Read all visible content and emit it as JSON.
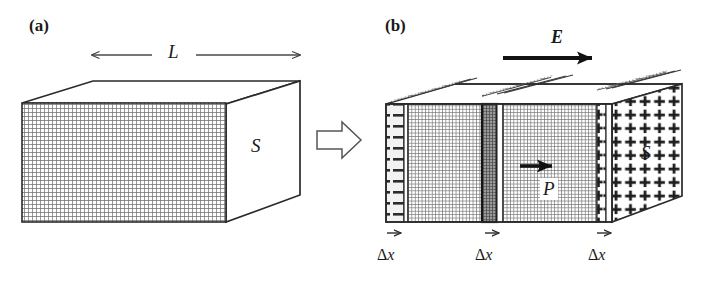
{
  "figure": {
    "type": "physics-diagram",
    "background_color": "#ffffff",
    "ink_color": "#1a1a1a"
  },
  "panel_a": {
    "tag": "(a)",
    "length_label": "L",
    "face_label": "S",
    "dimension_arrow": {
      "name": "length-dimension-arrow",
      "direction": "double-headed-horizontal"
    },
    "block": {
      "front_face_fill": "cross-hatch-grid",
      "top_face_fill": "white",
      "right_face_fill": "white"
    }
  },
  "transition": {
    "arrow_name": "block-arrow-right",
    "glyph": "⇨"
  },
  "panel_b": {
    "tag": "(b)",
    "field_label": "E",
    "field_arrow": {
      "name": "electric-field-arrow",
      "direction": "right"
    },
    "polarization_label": "P",
    "polarization_arrow": {
      "name": "polarization-arrow",
      "direction": "right"
    },
    "face_label": "S",
    "negative_charge_glyph": "−",
    "positive_charge_glyph": "+",
    "slab_labels": [
      {
        "text_delta": "Δ",
        "text_var": "x",
        "arrow": "→"
      },
      {
        "text_delta": "Δ",
        "text_var": "x",
        "arrow": "→"
      },
      {
        "text_delta": "Δ",
        "text_var": "x",
        "arrow": "→"
      }
    ],
    "slab_count": 3,
    "left_surface_charge": "negative",
    "right_surface_charge": "positive"
  },
  "colors": {
    "ink": "#1a1a1a",
    "hatch": "#707070",
    "hatch_light": "#8a8a8a",
    "white": "#ffffff",
    "dark_slab": "#4a4a4a"
  }
}
